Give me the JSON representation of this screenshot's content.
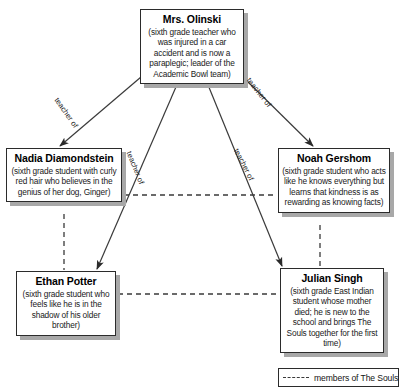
{
  "diagram": {
    "nodes": [
      {
        "id": "olinski",
        "name": "Mrs. Olinski",
        "description": "(sixth grade teacher who was injured in a car accident and is now a paraplegic; leader of the Academic Bowl team)"
      },
      {
        "id": "nadia",
        "name": "Nadia Diamondstein",
        "description": "(sixth grade student with curly red hair who believes in the genius of her dog, Ginger)"
      },
      {
        "id": "noah",
        "name": "Noah Gershom",
        "description": "(sixth grade student who acts like he knows everything but learns that kindness is as rewarding as knowing facts)"
      },
      {
        "id": "ethan",
        "name": "Ethan Potter",
        "description": "(sixth grade student who feels like he is in the shadow of his older brother)"
      },
      {
        "id": "julian",
        "name": "Julian Singh",
        "description": "(sixth grade East Indian student whose mother died; he is new to the school and brings The Souls together for the first time)"
      }
    ],
    "edge_labels": {
      "olinski_to_nadia": "teacher of",
      "olinski_to_noah": "teacher of",
      "olinski_to_ethan": "teacher of",
      "olinski_to_julian": "teacher of"
    },
    "legend": {
      "line_style": "dashed",
      "label": "members of The Souls"
    },
    "colors": {
      "line": "#3a3a3a",
      "box_border": "#2b2b2b",
      "box_shadow": "#a8a8a8",
      "text": "#141414",
      "background": "#ffffff"
    }
  }
}
